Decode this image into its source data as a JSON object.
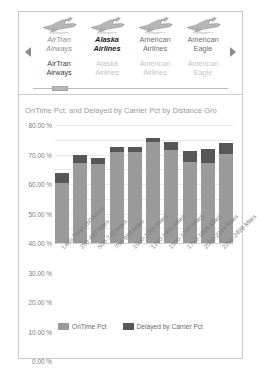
{
  "carousel": {
    "prev_label": "◀",
    "next_label": "▶",
    "items": [
      {
        "icon": "airplane-icon",
        "title": "AirTran Airways",
        "subtitle": "AirTran Airways",
        "selected": false
      },
      {
        "icon": "airplane-icon",
        "title": "Alaska Airlines",
        "subtitle": "Alaska Airlines",
        "selected": true
      },
      {
        "icon": "airplane-icon",
        "title": "American Airlines",
        "subtitle": "American Airlines",
        "selected": false
      },
      {
        "icon": "airplane-icon",
        "title": "American Eagle",
        "subtitle": "American Eagle",
        "selected": false
      }
    ]
  },
  "chart_data": {
    "type": "bar",
    "stacked": true,
    "title": "OnTime Pct, and Delayed by Carrier Pct by Distance Gro",
    "xlabel": "",
    "ylabel": "",
    "ylim": [
      0,
      80
    ],
    "grid": true,
    "legend_position": "bottom",
    "ytick_labels": [
      "80.00 %",
      "70.00 %",
      "60.00 %",
      "50.00 %",
      "40.00 %",
      "30.00 %",
      "20.00 %",
      "10.00 %",
      "0.00 %"
    ],
    "ytick_values": [
      80,
      70,
      60,
      50,
      40,
      30,
      20,
      10,
      0
    ],
    "categories": [
      "Less Than 250 Miles",
      "250-499 Miles",
      "500-749 Miles",
      "750-999 Miles",
      "1000-1249 Miles",
      "1250-1499 Miles",
      "1500-1749 Miles",
      "1750-1999 Miles",
      "2000-2249 Miles",
      "2250-2499 Miles"
    ],
    "series": [
      {
        "name": "OnTime Pct",
        "color": "#9a9a9a",
        "values": [
          40.5,
          54.5,
          53.5,
          62.0,
          61.5,
          68.5,
          63.0,
          55.0,
          54.5,
          60.5
        ]
      },
      {
        "name": "Delayed by Carrier Pct",
        "color": "#575757",
        "values": [
          7.0,
          5.5,
          4.0,
          3.0,
          3.5,
          3.0,
          5.5,
          7.5,
          9.0,
          7.5
        ]
      }
    ],
    "totals": [
      47.5,
      60.0,
      57.5,
      65.0,
      65.0,
      71.5,
      68.5,
      62.5,
      63.5,
      68.0
    ]
  }
}
